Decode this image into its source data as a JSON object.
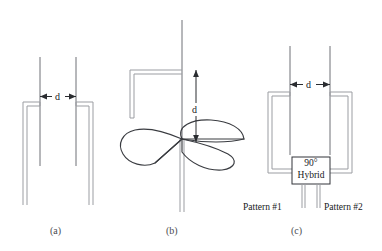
{
  "figure": {
    "type": "technical-line-diagram",
    "background_color": "#ffffff",
    "line_color": "#33353a",
    "light_line_color": "#9b9da2"
  },
  "panels": [
    {
      "id": "a",
      "caption": "(a)",
      "dimension_label": "d",
      "description": "Two parallel vertical probes separated by gap d with U-shaped double-walled shield"
    },
    {
      "id": "b",
      "caption": "(b)",
      "dimension_label": "d",
      "description": "Three-blade turnstile radiator on vertical mast with L-shaped feed bracket, height d"
    },
    {
      "id": "c",
      "caption": "(c)",
      "dimension_label": "d",
      "description": "Two probes separated by d feeding a 90 degree hybrid with two pattern outputs"
    }
  ],
  "hybrid_box": {
    "line1": "90°",
    "line2": "Hybrid"
  },
  "outputs": {
    "left": "Pattern #1",
    "right": "Pattern #2"
  }
}
